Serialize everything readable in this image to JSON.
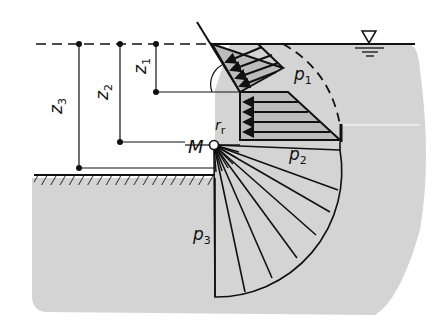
{
  "diagram": {
    "title": "",
    "type": "pressure distribution on wall with rounded corner",
    "labels": {
      "z1": {
        "base": "z",
        "sub": "1"
      },
      "z2": {
        "base": "z",
        "sub": "2"
      },
      "z3": {
        "base": "z",
        "sub": "3"
      },
      "M": "M",
      "rr": {
        "base": "r",
        "sub": "r"
      },
      "p1": {
        "base": "p",
        "sub": "1"
      },
      "p2": {
        "base": "p",
        "sub": "2"
      },
      "p3": {
        "base": "p",
        "sub": "3"
      }
    },
    "symbols": {
      "water_level": "water-level-triangle-icon"
    },
    "colors": {
      "fill_gray": "#d4d4d4",
      "line": "#111111",
      "background": "#ffffff"
    }
  }
}
